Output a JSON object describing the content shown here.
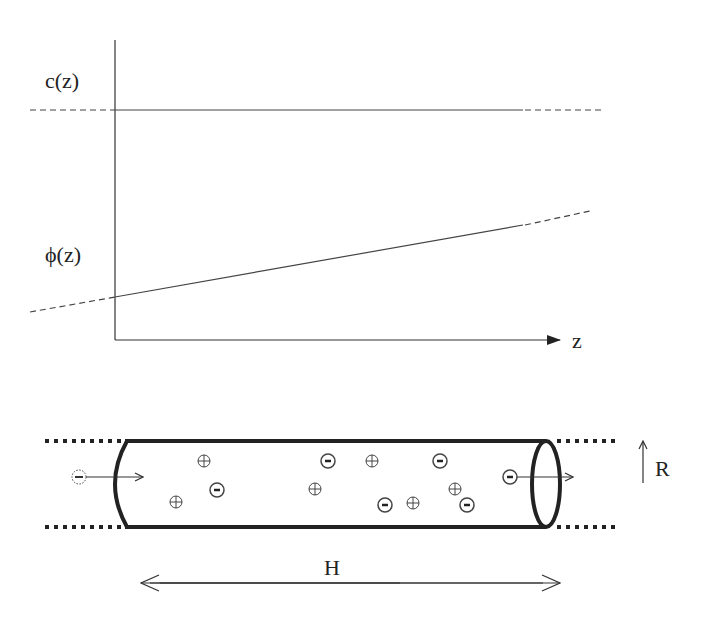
{
  "plot": {
    "labels": {
      "c": "c(z)",
      "phi": "ϕ(z)",
      "z": "z"
    },
    "c_line": {
      "y": 110,
      "dash_left": [
        30,
        115
      ],
      "solid": [
        115,
        523
      ],
      "dash_right": [
        523,
        602
      ]
    },
    "phi_line": {
      "dash_left": [
        [
          30,
          312
        ],
        [
          115,
          297
        ]
      ],
      "solid": [
        [
          115,
          297
        ],
        [
          523,
          225
        ]
      ],
      "dash_right": [
        [
          523,
          225
        ],
        [
          590,
          211
        ]
      ]
    }
  },
  "channel": {
    "labels": {
      "length": "H",
      "radius": "R"
    },
    "ions": [
      {
        "type": "plus",
        "x": 204,
        "y": 461
      },
      {
        "type": "minus",
        "x": 217,
        "y": 490
      },
      {
        "type": "plus",
        "x": 176,
        "y": 502
      },
      {
        "type": "minus",
        "x": 328,
        "y": 461
      },
      {
        "type": "plus",
        "x": 315,
        "y": 489
      },
      {
        "type": "plus",
        "x": 372,
        "y": 461
      },
      {
        "type": "minus",
        "x": 440,
        "y": 461
      },
      {
        "type": "plus",
        "x": 455,
        "y": 489
      },
      {
        "type": "minus",
        "x": 385,
        "y": 505
      },
      {
        "type": "plus",
        "x": 413,
        "y": 503
      },
      {
        "type": "minus",
        "x": 467,
        "y": 505
      },
      {
        "type": "minus",
        "x": 510,
        "y": 477
      }
    ],
    "incoming_ion": {
      "type": "minus",
      "x": 79,
      "y": 477
    }
  }
}
